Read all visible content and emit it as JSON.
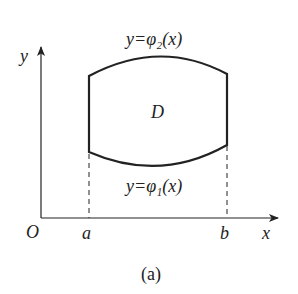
{
  "figure": {
    "caption": "(a)",
    "region_label": "D",
    "upper_curve_label": "y=φ₂(x)",
    "lower_curve_label": "y=φ₁(x)",
    "axes": {
      "x_label": "x",
      "y_label": "y",
      "origin_label": "O"
    },
    "bounds": {
      "left": "a",
      "right": "b"
    },
    "colors": {
      "stroke": "#222222",
      "background": "#ffffff"
    }
  }
}
